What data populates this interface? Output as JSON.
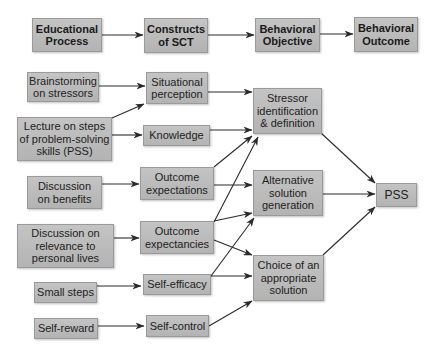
{
  "header_row": [
    {
      "id": "h1",
      "label": "Educational\nProcess"
    },
    {
      "id": "h2",
      "label": "Constructs\nof SCT"
    },
    {
      "id": "h3",
      "label": "Behavioral\nObjective"
    },
    {
      "id": "h4",
      "label": "Behavioral\nOutcome"
    }
  ],
  "educational_process": [
    {
      "id": "e1",
      "label": "Brainstorming\non stressors"
    },
    {
      "id": "e2",
      "label": "Lecture on steps\nof problem-solving\nskills (PSS)"
    },
    {
      "id": "e3",
      "label": "Discussion\non benefits"
    },
    {
      "id": "e4",
      "label": "Discussion on\nrelevance to\npersonal lives"
    },
    {
      "id": "e5",
      "label": "Small steps"
    },
    {
      "id": "e6",
      "label": "Self-reward"
    }
  ],
  "constructs": [
    {
      "id": "c1",
      "label": "Situational\nperception"
    },
    {
      "id": "c2",
      "label": "Knowledge"
    },
    {
      "id": "c3",
      "label": "Outcome\nexpectations"
    },
    {
      "id": "c4",
      "label": "Outcome\nexpectancies"
    },
    {
      "id": "c5",
      "label": "Self-efficacy"
    },
    {
      "id": "c6",
      "label": "Self-control"
    }
  ],
  "objectives": [
    {
      "id": "o1",
      "label": "Stressor\nidentification\n& definition"
    },
    {
      "id": "o2",
      "label": "Alternative\nsolution\ngeneration"
    },
    {
      "id": "o3",
      "label": "Choice of an\nappropriate\nsolution"
    }
  ],
  "outcome": {
    "id": "p1",
    "label": "PSS"
  },
  "edges": [
    [
      "h1",
      "h2"
    ],
    [
      "h2",
      "h3"
    ],
    [
      "h3",
      "h4"
    ],
    [
      "e1",
      "c1"
    ],
    [
      "e2",
      "c1"
    ],
    [
      "e2",
      "c2"
    ],
    [
      "e3",
      "c3"
    ],
    [
      "e4",
      "c4"
    ],
    [
      "e5",
      "c5"
    ],
    [
      "e6",
      "c6"
    ],
    [
      "c1",
      "o1"
    ],
    [
      "c2",
      "o1"
    ],
    [
      "c3",
      "o1"
    ],
    [
      "c3",
      "o2"
    ],
    [
      "c4",
      "o1"
    ],
    [
      "c4",
      "o2"
    ],
    [
      "c4",
      "o3"
    ],
    [
      "c5",
      "o2"
    ],
    [
      "c5",
      "o3"
    ],
    [
      "c6",
      "o3"
    ],
    [
      "o1",
      "p1"
    ],
    [
      "o2",
      "p1"
    ],
    [
      "o3",
      "p1"
    ]
  ],
  "colors": {
    "box_fill": "#bdbdbd",
    "box_border": "#9a9a9a",
    "arrow": "#2a2a2a",
    "text": "#222222"
  }
}
